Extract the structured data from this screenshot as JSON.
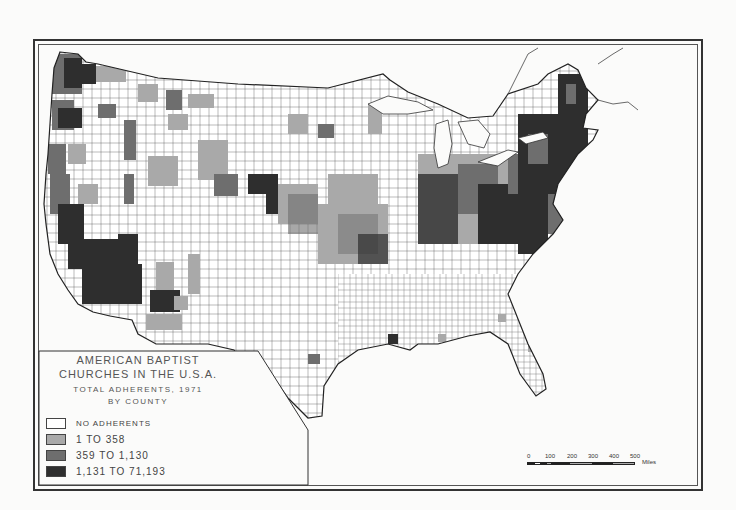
{
  "legend": {
    "title_line1": "AMERICAN BAPTIST",
    "title_line2": "CHURCHES IN THE U.S.A.",
    "subtitle_line1": "TOTAL ADHERENTS, 1971",
    "subtitle_line2": "BY COUNTY",
    "items": [
      {
        "label": "NO ADHERENTS",
        "color": "#ffffff"
      },
      {
        "label": "1 TO 358",
        "color": "#a9a9a9"
      },
      {
        "label": "359 TO 1,130",
        "color": "#6e6e6e"
      },
      {
        "label": "1,131 TO 71,193",
        "color": "#2e2e2e"
      }
    ]
  },
  "scale": {
    "ticks": [
      "0",
      "100",
      "200",
      "300",
      "400",
      "500"
    ],
    "unit": "Miles"
  },
  "colors": {
    "none": "#ffffff",
    "low": "#a9a9a9",
    "mid": "#6e6e6e",
    "high": "#2e2e2e",
    "border": "#333333"
  }
}
